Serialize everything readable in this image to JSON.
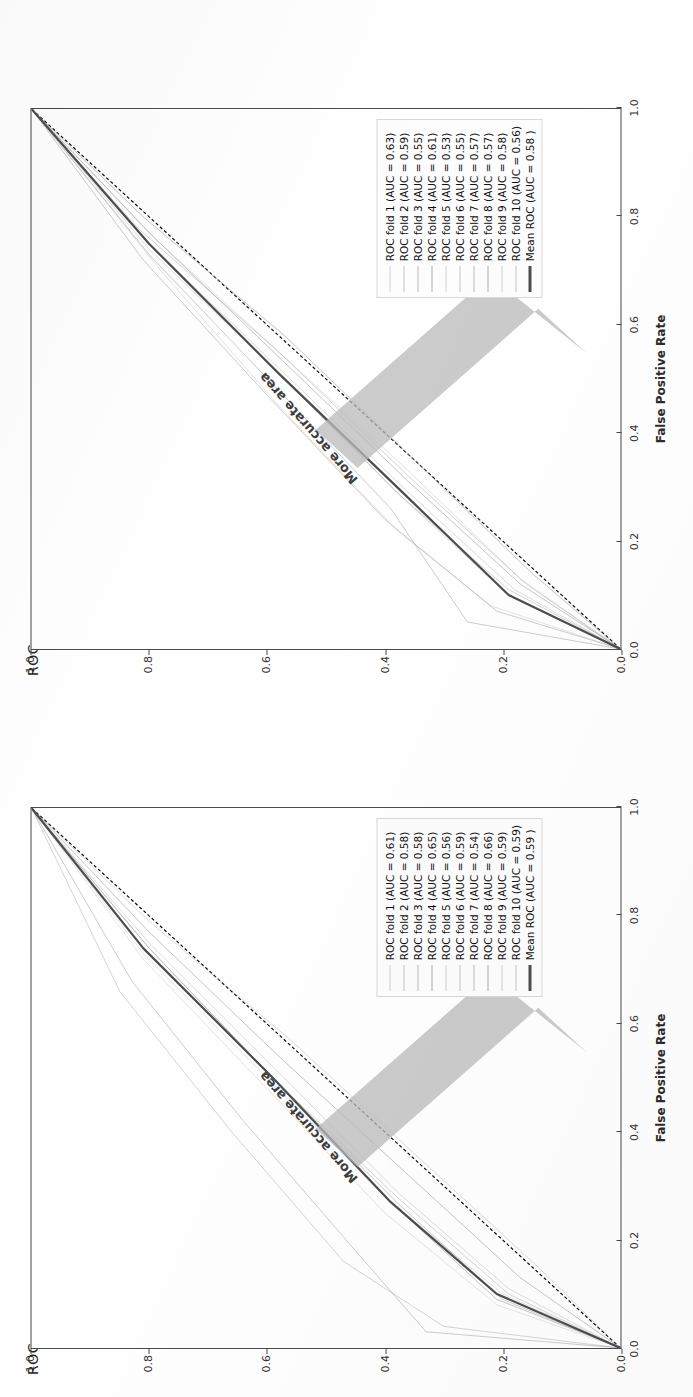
{
  "page": {
    "background_color": "#ffffff",
    "layout": "two ROC figures stacked, each rotated 90 degrees counter-clockwise"
  },
  "palette": {
    "mean_curve": "#4d4d4d",
    "chance_line": "#111111",
    "fold_curve": "#9a9a9a",
    "arrow_fill": "#b9b9b9",
    "axis": "#4a4a4a",
    "legend_border": "#d8d8d8",
    "text": "#1a1a1a"
  },
  "figures": [
    {
      "id": "roc-top",
      "title": "ROC",
      "annotation": "More accurate area",
      "xlabel": "False Positive Rate",
      "ylabel": "True Positive Rate",
      "ticks": [
        "0.0",
        "0.2",
        "0.4",
        "0.6",
        "0.8",
        "1.0"
      ],
      "legend": [
        {
          "label": "ROC fold 1 (AUC = 0.63)",
          "style": "fold"
        },
        {
          "label": "ROC fold 2 (AUC = 0.59)",
          "style": "fold"
        },
        {
          "label": "ROC fold 3 (AUC = 0.55)",
          "style": "fold"
        },
        {
          "label": "ROC fold 4 (AUC = 0.61)",
          "style": "fold"
        },
        {
          "label": "ROC fold 5 (AUC = 0.53)",
          "style": "fold"
        },
        {
          "label": "ROC fold 6 (AUC = 0.55)",
          "style": "fold"
        },
        {
          "label": "ROC fold 7 (AUC = 0.57)",
          "style": "fold"
        },
        {
          "label": "ROC fold 8 (AUC = 0.57)",
          "style": "fold"
        },
        {
          "label": "ROC fold 9 (AUC = 0.58)",
          "style": "fold"
        },
        {
          "label": "ROC fold 10 (AUC = 0.56)",
          "style": "fold"
        },
        {
          "label": "Mean ROC (AUC = 0.58 )",
          "style": "mean"
        }
      ]
    },
    {
      "id": "roc-bottom",
      "title": "ROC",
      "annotation": "More accurate area",
      "xlabel": "False Positive Rate",
      "ylabel": "True Positive Rate",
      "ticks": [
        "0.0",
        "0.2",
        "0.4",
        "0.6",
        "0.8",
        "1.0"
      ],
      "legend": [
        {
          "label": "ROC fold 1 (AUC = 0.61)",
          "style": "fold"
        },
        {
          "label": "ROC fold 2 (AUC = 0.58)",
          "style": "fold"
        },
        {
          "label": "ROC fold 3 (AUC = 0.58)",
          "style": "fold"
        },
        {
          "label": "ROC fold 4 (AUC = 0.65)",
          "style": "fold"
        },
        {
          "label": "ROC fold 5 (AUC = 0.56)",
          "style": "fold"
        },
        {
          "label": "ROC fold 6 (AUC = 0.59)",
          "style": "fold"
        },
        {
          "label": "ROC fold 7 (AUC = 0.54)",
          "style": "fold"
        },
        {
          "label": "ROC fold 8 (AUC = 0.66)",
          "style": "fold"
        },
        {
          "label": "ROC fold 9 (AUC = 0.59)",
          "style": "fold"
        },
        {
          "label": "ROC fold 10 (AUC = 0.59)",
          "style": "fold"
        },
        {
          "label": "Mean ROC (AUC = 0.59 )",
          "style": "mean"
        }
      ]
    }
  ],
  "chart_data": [
    {
      "id": "roc-top",
      "type": "line",
      "title": "ROC",
      "xlabel": "False Positive Rate",
      "ylabel": "True Positive Rate",
      "xlim": [
        0.0,
        1.0
      ],
      "ylim": [
        0.0,
        1.0
      ],
      "xticks": [
        0.0,
        0.2,
        0.4,
        0.6,
        0.8,
        1.0
      ],
      "yticks": [
        0.0,
        0.2,
        0.4,
        0.6,
        0.8,
        1.0
      ],
      "grid": false,
      "legend_position": "lower right",
      "annotations": [
        {
          "text": "More accurate area",
          "note": "gray arrow pointing toward upper-left above the diagonal"
        }
      ],
      "reference_line": {
        "name": "chance",
        "style": "dashed",
        "x": [
          0.0,
          1.0
        ],
        "y": [
          0.0,
          1.0
        ]
      },
      "series": [
        {
          "name": "ROC fold 1",
          "auc": 0.63,
          "x": [
            0.0,
            0.08,
            0.22,
            0.45,
            0.7,
            1.0
          ],
          "y": [
            0.0,
            0.22,
            0.38,
            0.58,
            0.78,
            1.0
          ]
        },
        {
          "name": "ROC fold 2",
          "auc": 0.59,
          "x": [
            0.0,
            0.1,
            0.28,
            0.5,
            0.74,
            1.0
          ],
          "y": [
            0.0,
            0.19,
            0.37,
            0.57,
            0.8,
            1.0
          ]
        },
        {
          "name": "ROC fold 3",
          "auc": 0.55,
          "x": [
            0.0,
            0.12,
            0.32,
            0.55,
            0.78,
            1.0
          ],
          "y": [
            0.0,
            0.16,
            0.36,
            0.58,
            0.82,
            1.0
          ]
        },
        {
          "name": "ROC fold 4",
          "auc": 0.61,
          "x": [
            0.0,
            0.07,
            0.24,
            0.47,
            0.72,
            1.0
          ],
          "y": [
            0.0,
            0.21,
            0.4,
            0.6,
            0.81,
            1.0
          ]
        },
        {
          "name": "ROC fold 5",
          "auc": 0.53,
          "x": [
            0.0,
            0.14,
            0.35,
            0.58,
            0.8,
            1.0
          ],
          "y": [
            0.0,
            0.15,
            0.35,
            0.57,
            0.81,
            1.0
          ]
        },
        {
          "name": "ROC fold 6",
          "auc": 0.55,
          "x": [
            0.0,
            0.13,
            0.33,
            0.55,
            0.77,
            1.0
          ],
          "y": [
            0.0,
            0.17,
            0.36,
            0.58,
            0.8,
            1.0
          ]
        },
        {
          "name": "ROC fold 7",
          "auc": 0.57,
          "x": [
            0.0,
            0.11,
            0.3,
            0.52,
            0.75,
            1.0
          ],
          "y": [
            0.0,
            0.18,
            0.37,
            0.58,
            0.8,
            1.0
          ]
        },
        {
          "name": "ROC fold 8",
          "auc": 0.57,
          "x": [
            0.0,
            0.11,
            0.29,
            0.51,
            0.75,
            1.0
          ],
          "y": [
            0.0,
            0.19,
            0.38,
            0.58,
            0.8,
            1.0
          ]
        },
        {
          "name": "ROC fold 9",
          "auc": 0.58,
          "x": [
            0.0,
            0.05,
            0.26,
            0.49,
            0.73,
            1.0
          ],
          "y": [
            0.0,
            0.26,
            0.39,
            0.59,
            0.8,
            1.0
          ]
        },
        {
          "name": "ROC fold 10",
          "auc": 0.56,
          "x": [
            0.0,
            0.12,
            0.31,
            0.53,
            0.76,
            1.0
          ],
          "y": [
            0.0,
            0.17,
            0.36,
            0.57,
            0.79,
            1.0
          ]
        },
        {
          "name": "Mean ROC",
          "auc": 0.58,
          "x": [
            0.0,
            0.1,
            0.29,
            0.51,
            0.75,
            1.0
          ],
          "y": [
            0.0,
            0.19,
            0.37,
            0.58,
            0.8,
            1.0
          ]
        }
      ]
    },
    {
      "id": "roc-bottom",
      "type": "line",
      "title": "ROC",
      "xlabel": "False Positive Rate",
      "ylabel": "True Positive Rate",
      "xlim": [
        0.0,
        1.0
      ],
      "ylim": [
        0.0,
        1.0
      ],
      "xticks": [
        0.0,
        0.2,
        0.4,
        0.6,
        0.8,
        1.0
      ],
      "yticks": [
        0.0,
        0.2,
        0.4,
        0.6,
        0.8,
        1.0
      ],
      "grid": false,
      "legend_position": "lower right",
      "annotations": [
        {
          "text": "More accurate area",
          "note": "gray arrow pointing toward upper-left above the diagonal"
        }
      ],
      "reference_line": {
        "name": "chance",
        "style": "dashed",
        "x": [
          0.0,
          1.0
        ],
        "y": [
          0.0,
          1.0
        ]
      },
      "series": [
        {
          "name": "ROC fold 1",
          "auc": 0.61,
          "x": [
            0.0,
            0.08,
            0.25,
            0.48,
            0.72,
            1.0
          ],
          "y": [
            0.0,
            0.21,
            0.4,
            0.6,
            0.81,
            1.0
          ]
        },
        {
          "name": "ROC fold 2",
          "auc": 0.58,
          "x": [
            0.0,
            0.11,
            0.29,
            0.51,
            0.75,
            1.0
          ],
          "y": [
            0.0,
            0.19,
            0.38,
            0.58,
            0.8,
            1.0
          ]
        },
        {
          "name": "ROC fold 3",
          "auc": 0.58,
          "x": [
            0.0,
            0.1,
            0.28,
            0.5,
            0.74,
            1.0
          ],
          "y": [
            0.0,
            0.19,
            0.38,
            0.59,
            0.8,
            1.0
          ]
        },
        {
          "name": "ROC fold 4",
          "auc": 0.65,
          "x": [
            0.0,
            0.03,
            0.18,
            0.42,
            0.68,
            1.0
          ],
          "y": [
            0.0,
            0.33,
            0.45,
            0.64,
            0.83,
            1.0
          ]
        },
        {
          "name": "ROC fold 5",
          "auc": 0.56,
          "x": [
            0.0,
            0.13,
            0.32,
            0.54,
            0.77,
            1.0
          ],
          "y": [
            0.0,
            0.17,
            0.36,
            0.58,
            0.8,
            1.0
          ]
        },
        {
          "name": "ROC fold 6",
          "auc": 0.59,
          "x": [
            0.0,
            0.1,
            0.27,
            0.49,
            0.73,
            1.0
          ],
          "y": [
            0.0,
            0.2,
            0.39,
            0.59,
            0.81,
            1.0
          ]
        },
        {
          "name": "ROC fold 7",
          "auc": 0.54,
          "x": [
            0.0,
            0.15,
            0.35,
            0.57,
            0.79,
            1.0
          ],
          "y": [
            0.0,
            0.14,
            0.34,
            0.56,
            0.8,
            1.0
          ]
        },
        {
          "name": "ROC fold 8",
          "auc": 0.66,
          "x": [
            0.0,
            0.04,
            0.16,
            0.4,
            0.66,
            1.0
          ],
          "y": [
            0.0,
            0.3,
            0.47,
            0.66,
            0.85,
            1.0
          ]
        },
        {
          "name": "ROC fold 9",
          "auc": 0.59,
          "x": [
            0.0,
            0.09,
            0.27,
            0.5,
            0.74,
            1.0
          ],
          "y": [
            0.0,
            0.2,
            0.38,
            0.59,
            0.8,
            1.0
          ]
        },
        {
          "name": "ROC fold 10",
          "auc": 0.59,
          "x": [
            0.0,
            0.09,
            0.27,
            0.5,
            0.74,
            1.0
          ],
          "y": [
            0.0,
            0.21,
            0.39,
            0.59,
            0.81,
            1.0
          ]
        },
        {
          "name": "Mean ROC",
          "auc": 0.59,
          "x": [
            0.0,
            0.1,
            0.27,
            0.5,
            0.74,
            1.0
          ],
          "y": [
            0.0,
            0.21,
            0.39,
            0.59,
            0.81,
            1.0
          ]
        }
      ]
    }
  ]
}
